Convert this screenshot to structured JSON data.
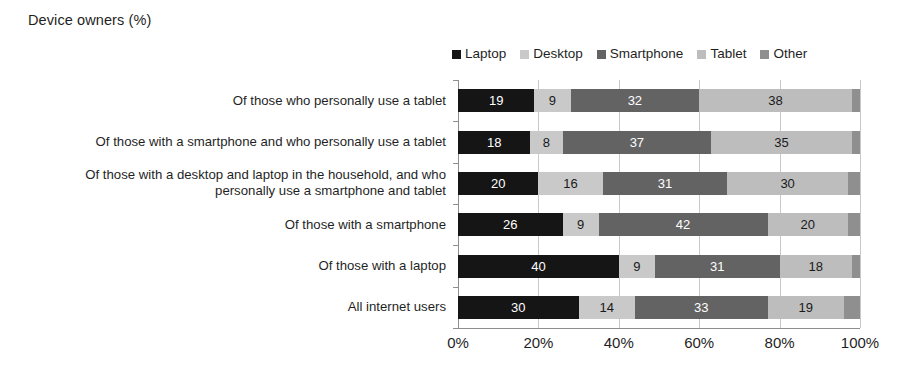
{
  "chart": {
    "title": "Device owners (%)"
  },
  "legend": {
    "position": "top-right",
    "items": [
      {
        "label": "Laptop",
        "color": "#151515"
      },
      {
        "label": "Desktop",
        "color": "#c9c9c9"
      },
      {
        "label": "Smartphone",
        "color": "#636363"
      },
      {
        "label": "Tablet",
        "color": "#bdbdbd"
      },
      {
        "label": "Other",
        "color": "#8f8f8f"
      }
    ]
  },
  "axis": {
    "x_ticks": [
      "0%",
      "20%",
      "40%",
      "60%",
      "80%",
      "100%"
    ],
    "x_tick_values": [
      0,
      20,
      40,
      60,
      80,
      100
    ],
    "xlim": [
      0,
      100
    ]
  },
  "chart_data": {
    "type": "bar",
    "orientation": "horizontal",
    "stacked": true,
    "stacked_mode": "percent",
    "title": "Device owners (%)",
    "xlabel": "",
    "ylabel": "",
    "xlim": [
      0,
      100
    ],
    "x_ticks": [
      0,
      20,
      40,
      60,
      80,
      100
    ],
    "x_tick_labels": [
      "0%",
      "20%",
      "40%",
      "60%",
      "80%",
      "100%"
    ],
    "grid": true,
    "legend_position": "top-right",
    "categories": [
      "Of those who personally use a tablet",
      "Of those with a smartphone and who personally use a tablet",
      "Of those with a desktop and laptop in the household, and who personally use a smartphone and tablet",
      "Of those with a smartphone",
      "Of those with a laptop",
      "All internet users"
    ],
    "series": [
      {
        "name": "Laptop",
        "color": "#151515",
        "label_color": "#ffffff",
        "values": [
          19,
          18,
          20,
          26,
          40,
          30
        ]
      },
      {
        "name": "Desktop",
        "color": "#c9c9c9",
        "label_color": "#1a1a1a",
        "values": [
          9,
          8,
          16,
          9,
          9,
          14
        ]
      },
      {
        "name": "Smartphone",
        "color": "#636363",
        "label_color": "#ffffff",
        "values": [
          32,
          37,
          31,
          42,
          31,
          33
        ]
      },
      {
        "name": "Tablet",
        "color": "#bdbdbd",
        "label_color": "#1a1a1a",
        "values": [
          38,
          35,
          30,
          20,
          18,
          19
        ]
      },
      {
        "name": "Other",
        "color": "#8f8f8f",
        "label_color": "#1a1a1a",
        "values": [
          2,
          2,
          3,
          3,
          2,
          4
        ]
      }
    ],
    "visible_value_labels": [
      [
        19,
        9,
        32,
        38,
        null
      ],
      [
        18,
        8,
        37,
        35,
        null
      ],
      [
        20,
        16,
        31,
        30,
        null
      ],
      [
        26,
        9,
        42,
        20,
        null
      ],
      [
        40,
        9,
        31,
        18,
        null
      ],
      [
        30,
        14,
        33,
        19,
        null
      ]
    ]
  }
}
